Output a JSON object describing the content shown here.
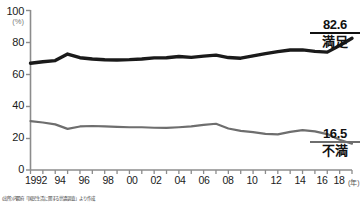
{
  "chart_data": {
    "type": "line",
    "title": "",
    "xlabel": "(年)",
    "ylabel": "(%)",
    "ylim": [
      0,
      100
    ],
    "xlim": [
      1992,
      2018
    ],
    "grid": false,
    "legend_position": "right-end-of-line",
    "yticks": [
      0,
      20,
      40,
      60,
      80,
      100
    ],
    "ytick_labels": [
      "0",
      "20",
      "40",
      "60",
      "80",
      "100"
    ],
    "x": [
      1992,
      1993,
      1994,
      1995,
      1996,
      1997,
      1998,
      1999,
      2000,
      2001,
      2002,
      2003,
      2004,
      2005,
      2006,
      2007,
      2008,
      2009,
      2010,
      2011,
      2012,
      2013,
      2014,
      2015,
      2016,
      2017,
      2018
    ],
    "xtick_labels": [
      "1992",
      "",
      "94",
      "",
      "96",
      "",
      "98",
      "",
      "00",
      "",
      "02",
      "",
      "04",
      "",
      "06",
      "",
      "08",
      "",
      "10",
      "",
      "12",
      "",
      "14",
      "",
      "16",
      "",
      "18"
    ],
    "series": [
      {
        "name": "満足",
        "color": "#1a1a1a",
        "end_value": 82.6,
        "values": [
          66.9,
          67.9,
          68.6,
          72.7,
          70.4,
          69.6,
          69.1,
          69.0,
          69.2,
          69.6,
          70.3,
          70.4,
          71.2,
          70.6,
          71.4,
          72.0,
          70.5,
          70.1,
          71.6,
          73.0,
          74.2,
          75.2,
          75.3,
          74.4,
          73.9,
          78.1,
          82.6
        ]
      },
      {
        "name": "不満",
        "color": "#6e6e6e",
        "end_value": 16.5,
        "values": [
          30.6,
          29.8,
          28.6,
          25.8,
          27.3,
          27.6,
          27.3,
          27.0,
          26.8,
          26.8,
          26.5,
          26.4,
          26.8,
          27.3,
          28.3,
          29.0,
          26.0,
          24.5,
          23.7,
          22.7,
          22.3,
          23.9,
          25.0,
          24.2,
          22.5,
          19.0,
          16.5
        ]
      }
    ]
  },
  "axis": {
    "y_unit": "(%)",
    "x_unit": "(年)"
  },
  "annotations": {
    "satisfied": {
      "value": "82.6",
      "term": "満足"
    },
    "dissatisfied": {
      "value": "16.5",
      "term": "不満"
    }
  },
  "source": {
    "note": "(出所)内閣府「国民生活に関する世論調査」より作成"
  }
}
